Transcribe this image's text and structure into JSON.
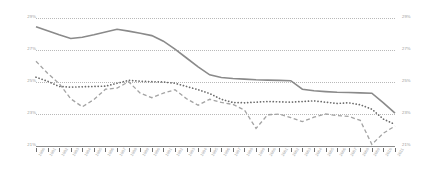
{
  "chart_data": {
    "type": "line",
    "title": "",
    "subtitle": "",
    "xlabel": "",
    "ylabel": "",
    "ylim": [
      21,
      29
    ],
    "grid": true,
    "legend": "none",
    "y_axis_left_ticks": [
      "29%",
      "27%",
      "25%",
      "23%",
      "21%"
    ],
    "y_axis_right_ticks": [
      "29%",
      "27%",
      "25%",
      "23%",
      "21%"
    ],
    "categories": [
      "1980",
      "1981",
      "1982",
      "1983",
      "1984",
      "1985",
      "1986",
      "1987",
      "1988",
      "1989",
      "1990",
      "1991",
      "1992",
      "1993",
      "1994",
      "1995",
      "1996",
      "1997",
      "1998",
      "1999",
      "2000",
      "2001",
      "2002",
      "2003",
      "2004",
      "2005",
      "2006",
      "2007",
      "2008",
      "2009",
      "2010",
      "2011"
    ],
    "series": [
      {
        "name": "solid-series",
        "style": "solid",
        "color": "#8a8a8a",
        "values": [
          28.45,
          28.2,
          27.95,
          27.72,
          27.8,
          27.95,
          28.12,
          28.3,
          28.18,
          28.05,
          27.9,
          27.55,
          27.05,
          26.5,
          25.95,
          25.45,
          25.28,
          25.22,
          25.18,
          25.14,
          25.12,
          25.1,
          25.08,
          24.55,
          24.45,
          24.4,
          24.36,
          24.34,
          24.32,
          24.3,
          23.7,
          23.05
        ]
      },
      {
        "name": "dotted-series",
        "style": "dotted",
        "color": "#6b6b6b",
        "values": [
          25.3,
          25.05,
          24.72,
          24.68,
          24.7,
          24.72,
          24.74,
          24.92,
          25.1,
          25.05,
          25.02,
          25.0,
          24.92,
          24.72,
          24.52,
          24.28,
          23.92,
          23.72,
          23.7,
          23.74,
          23.78,
          23.76,
          23.74,
          23.78,
          23.82,
          23.74,
          23.66,
          23.7,
          23.58,
          23.3,
          22.68,
          22.35
        ]
      },
      {
        "name": "dashed-series",
        "style": "dashed",
        "color": "#a3a3a3",
        "values": [
          26.3,
          25.55,
          24.9,
          23.95,
          23.45,
          23.9,
          24.55,
          24.62,
          25.02,
          24.3,
          24.02,
          24.3,
          24.52,
          23.95,
          23.55,
          23.92,
          23.72,
          23.6,
          23.25,
          22.1,
          22.95,
          23.0,
          22.78,
          22.52,
          22.8,
          23.0,
          22.9,
          22.85,
          22.6,
          21.1,
          21.8,
          22.25
        ]
      }
    ]
  }
}
